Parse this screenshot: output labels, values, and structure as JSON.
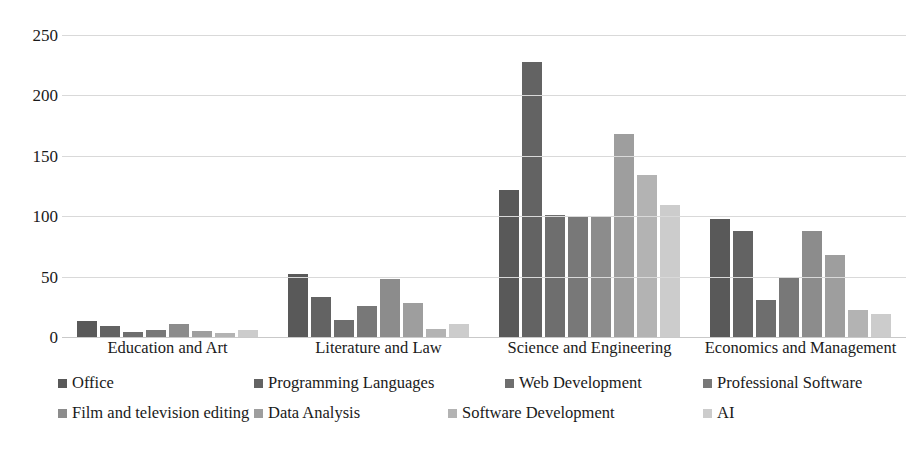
{
  "chart_data": {
    "type": "bar",
    "title": "",
    "subtitle": "",
    "xlabel": "",
    "ylabel": "",
    "ylim": [
      0,
      250
    ],
    "yticks": [
      0,
      50,
      100,
      150,
      200,
      250
    ],
    "grid": true,
    "legend_position": "bottom",
    "categories": [
      "Education and Art",
      "Literature and Law",
      "Science and Engineering",
      "Economics and Management"
    ],
    "series": [
      {
        "name": "Office",
        "color": "#595959",
        "values": [
          13,
          52,
          122,
          98
        ]
      },
      {
        "name": "Programming Languages",
        "color": "#636363",
        "values": [
          9,
          33,
          228,
          88
        ]
      },
      {
        "name": "Web Development",
        "color": "#6e6e6e",
        "values": [
          4,
          14,
          101,
          31
        ]
      },
      {
        "name": "Professional Software",
        "color": "#787878",
        "values": [
          6,
          26,
          99,
          50
        ]
      },
      {
        "name": "Film and television editing",
        "color": "#8c8c8c",
        "values": [
          11,
          48,
          99,
          88
        ]
      },
      {
        "name": "Data Analysis",
        "color": "#9e9e9e",
        "values": [
          5,
          28,
          168,
          68
        ]
      },
      {
        "name": "Software Development",
        "color": "#b3b3b3",
        "values": [
          3,
          7,
          134,
          22
        ]
      },
      {
        "name": "AI",
        "color": "#cccccc",
        "values": [
          6,
          11,
          109,
          19
        ]
      }
    ]
  },
  "axis": {
    "ytick_labels": [
      "250",
      "200",
      "150",
      "100",
      "50",
      "0"
    ]
  },
  "legend": {
    "items": [
      {
        "label": "Office",
        "color": "#595959"
      },
      {
        "label": "Programming Languages",
        "color": "#636363"
      },
      {
        "label": "Web Development",
        "color": "#6e6e6e"
      },
      {
        "label": "Professional Software",
        "color": "#787878"
      },
      {
        "label": "Film and television editing",
        "color": "#8c8c8c"
      },
      {
        "label": "Data Analysis",
        "color": "#9e9e9e"
      },
      {
        "label": "Software Development",
        "color": "#b3b3b3"
      },
      {
        "label": "AI",
        "color": "#cccccc"
      }
    ]
  },
  "colors": {
    "gridline": "#d9d9d9",
    "axis_text": "#1a1a1a",
    "background": "#ffffff"
  }
}
